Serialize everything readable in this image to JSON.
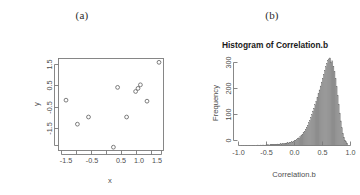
{
  "figure": {
    "background": "#ffffff",
    "panels": [
      {
        "label": "(a)",
        "type": "scatter"
      },
      {
        "label": "(b)",
        "type": "histogram"
      }
    ]
  },
  "panel_a": {
    "label": "(a)",
    "xlabel": "x",
    "ylabel": "y",
    "x_ticks": [
      "-1.5",
      "-0.5",
      "0.5",
      "1.0",
      "1.5"
    ],
    "y_ticks": [
      "1.5",
      "0.5",
      "-0.5",
      "-1.5"
    ]
  },
  "panel_b": {
    "label": "(b)",
    "title": "Histogram of Correlation.b",
    "xlabel": "Correlation.b",
    "ylabel": "Frequency",
    "x_ticks": [
      "-1.0",
      "-0.5",
      "0.0",
      "0.5",
      "1.0"
    ],
    "y_ticks": [
      "0",
      "100",
      "200",
      "300"
    ]
  },
  "chart_data": [
    {
      "type": "scatter",
      "title": "(a)",
      "xlabel": "x",
      "ylabel": "y",
      "xlim": [
        -1.85,
        1.65
      ],
      "ylim": [
        -1.75,
        1.85
      ],
      "xticks": [
        -1.5,
        -0.5,
        0.5,
        1.0,
        1.5
      ],
      "yticks": [
        1.5,
        0.5,
        -0.5,
        -1.5
      ],
      "grid": false,
      "legend": false,
      "marker": "open-circle",
      "marker_color": "#6e6e6e",
      "points": [
        {
          "x": -1.6,
          "y": 0.22
        },
        {
          "x": -1.22,
          "y": -0.72
        },
        {
          "x": -0.85,
          "y": -0.44
        },
        {
          "x": -0.02,
          "y": -1.62
        },
        {
          "x": 0.12,
          "y": 0.72
        },
        {
          "x": 0.42,
          "y": -0.44
        },
        {
          "x": 0.72,
          "y": 0.56
        },
        {
          "x": 0.8,
          "y": 0.68
        },
        {
          "x": 0.88,
          "y": 0.82
        },
        {
          "x": 1.1,
          "y": 0.18
        },
        {
          "x": 1.5,
          "y": 1.7
        }
      ]
    },
    {
      "type": "bar",
      "title": "Histogram of Correlation.b",
      "xlabel": "Correlation.b",
      "ylabel": "Frequency",
      "xlim": [
        -1.05,
        1.05
      ],
      "ylim": [
        0,
        370
      ],
      "xticks": [
        -1.0,
        -0.5,
        0.0,
        0.5,
        1.0
      ],
      "yticks": [
        0,
        100,
        200,
        300
      ],
      "grid": false,
      "legend": false,
      "bin_width": 0.02,
      "bar_color": "#9a9a9a",
      "bar_edge_color": "#6f6f6f",
      "bin_starts": [
        -1.0,
        -0.98,
        -0.96,
        -0.94,
        -0.92,
        -0.9,
        -0.88,
        -0.86,
        -0.84,
        -0.82,
        -0.8,
        -0.78,
        -0.76,
        -0.74,
        -0.72,
        -0.7,
        -0.68,
        -0.66,
        -0.64,
        -0.62,
        -0.6,
        -0.58,
        -0.56,
        -0.54,
        -0.52,
        -0.5,
        -0.48,
        -0.46,
        -0.44,
        -0.42,
        -0.4,
        -0.38,
        -0.36,
        -0.34,
        -0.32,
        -0.3,
        -0.28,
        -0.26,
        -0.24,
        -0.22,
        -0.2,
        -0.18,
        -0.16,
        -0.14,
        -0.12,
        -0.1,
        -0.08,
        -0.06,
        -0.04,
        -0.02,
        0.0,
        0.02,
        0.04,
        0.06,
        0.08,
        0.1,
        0.12,
        0.14,
        0.16,
        0.18,
        0.2,
        0.22,
        0.24,
        0.26,
        0.28,
        0.3,
        0.32,
        0.34,
        0.36,
        0.38,
        0.4,
        0.42,
        0.44,
        0.46,
        0.48,
        0.5,
        0.52,
        0.54,
        0.56,
        0.58,
        0.6,
        0.62,
        0.64,
        0.66,
        0.68,
        0.7,
        0.72,
        0.74,
        0.76,
        0.78,
        0.8,
        0.82,
        0.84,
        0.86,
        0.88,
        0.9,
        0.92,
        0.94,
        0.96,
        0.98
      ],
      "counts": [
        1,
        0,
        1,
        0,
        1,
        1,
        0,
        1,
        1,
        0,
        1,
        1,
        1,
        0,
        1,
        2,
        1,
        1,
        2,
        1,
        2,
        2,
        1,
        2,
        3,
        3,
        2,
        3,
        3,
        4,
        4,
        3,
        5,
        4,
        6,
        5,
        6,
        7,
        6,
        8,
        9,
        8,
        10,
        11,
        10,
        13,
        12,
        15,
        14,
        18,
        20,
        22,
        25,
        28,
        31,
        36,
        40,
        46,
        52,
        58,
        66,
        74,
        82,
        92,
        102,
        114,
        126,
        140,
        152,
        166,
        180,
        196,
        210,
        226,
        242,
        258,
        274,
        290,
        306,
        320,
        334,
        346,
        352,
        356,
        340,
        344,
        322,
        300,
        272,
        240,
        204,
        168,
        132,
        100,
        72,
        50,
        34,
        22,
        16,
        10
      ]
    }
  ]
}
